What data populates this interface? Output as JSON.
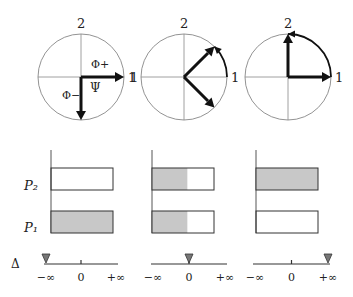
{
  "figure": {
    "fill_color": "#c8c8c8",
    "panels": [
      {
        "axis_labels": {
          "top": "2",
          "right": "1",
          "left": ""
        },
        "vector_labels": {
          "plus": "Φ+",
          "minus": "Φ−",
          "psi": "Ψ"
        },
        "vectors_deg": [
          0,
          -90
        ],
        "psi_deg": 0,
        "arc_from_deg": null,
        "arc_to_deg": null,
        "probabilities": {
          "P2": 0.0,
          "P1": 1.0
        },
        "delta_position": "-inf"
      },
      {
        "axis_labels": {
          "top": "2",
          "right": "1",
          "left": "1"
        },
        "vector_labels": {
          "plus": "",
          "minus": "",
          "psi": ""
        },
        "vectors_deg": [
          45,
          -45
        ],
        "psi_deg": null,
        "arc_from_deg": 0,
        "arc_to_deg": 45,
        "probabilities": {
          "P2": 0.57,
          "P1": 0.57
        },
        "delta_position": "0"
      },
      {
        "axis_labels": {
          "top": "2",
          "right": "1",
          "left": ""
        },
        "vector_labels": {
          "plus": "",
          "minus": "",
          "psi": ""
        },
        "vectors_deg": [
          90,
          0
        ],
        "psi_deg": null,
        "arc_from_deg": 0,
        "arc_to_deg": 90,
        "probabilities": {
          "P2": 1.0,
          "P1": 0.0
        },
        "delta_position": "+inf"
      }
    ],
    "bar_labels": {
      "P2": "P₂",
      "P1": "P₁"
    },
    "delta_label": "Δ",
    "delta_ticks": [
      "−∞",
      "0",
      "+∞"
    ]
  }
}
